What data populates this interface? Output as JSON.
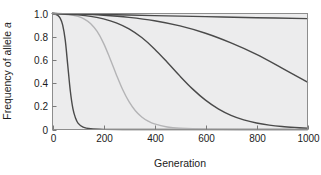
{
  "chart_data": {
    "type": "line",
    "title": "",
    "xlabel": "Generation",
    "ylabel": "Frequency of allele a",
    "ylabel_plain": "Frequency of allele ",
    "ylabel_italic": "a",
    "xlim": [
      0,
      1000
    ],
    "ylim": [
      0,
      1.0
    ],
    "xticks": [
      0,
      200,
      400,
      600,
      800,
      1000
    ],
    "xticklabels": [
      "0",
      "200",
      "400",
      "600",
      "800",
      "1000"
    ],
    "yticks": [
      0,
      0.2,
      0.4,
      0.6,
      0.8,
      1.0
    ],
    "yticklabels": [
      "0",
      "0.2",
      "0.4",
      "0.6",
      "0.8",
      "1.0"
    ],
    "grid": false,
    "legend": "none",
    "plot_background": "#ececed",
    "series": [
      {
        "name": "strong-selection",
        "color": "#4a4a4a",
        "width": 1.4,
        "x": [
          0,
          10,
          20,
          30,
          40,
          50,
          60,
          70,
          80,
          90,
          100,
          120,
          150,
          200,
          300,
          500,
          700,
          1000
        ],
        "y": [
          1.0,
          0.995,
          0.985,
          0.96,
          0.9,
          0.77,
          0.55,
          0.33,
          0.18,
          0.1,
          0.055,
          0.02,
          0.006,
          0.001,
          0.0,
          0.0,
          0.0,
          0.0
        ]
      },
      {
        "name": "moderate-selection-light",
        "color": "#b4b4b6",
        "width": 1.4,
        "x": [
          0,
          25,
          50,
          75,
          100,
          125,
          150,
          175,
          200,
          225,
          250,
          275,
          300,
          325,
          350,
          375,
          400,
          450,
          500,
          600,
          800,
          1000
        ],
        "y": [
          1.0,
          0.998,
          0.994,
          0.987,
          0.975,
          0.952,
          0.912,
          0.845,
          0.745,
          0.615,
          0.475,
          0.345,
          0.24,
          0.162,
          0.108,
          0.072,
          0.048,
          0.022,
          0.011,
          0.003,
          0.0,
          0.0
        ]
      },
      {
        "name": "weak-selection-dark",
        "color": "#4a4a4a",
        "width": 1.4,
        "x": [
          0,
          50,
          100,
          150,
          200,
          250,
          300,
          350,
          400,
          450,
          500,
          550,
          600,
          650,
          700,
          750,
          800,
          850,
          900,
          950,
          1000
        ],
        "y": [
          1.0,
          0.996,
          0.988,
          0.975,
          0.954,
          0.92,
          0.868,
          0.793,
          0.695,
          0.58,
          0.46,
          0.348,
          0.253,
          0.178,
          0.122,
          0.083,
          0.056,
          0.038,
          0.026,
          0.018,
          0.012
        ]
      },
      {
        "name": "very-weak-selection",
        "color": "#4a4a4a",
        "width": 1.4,
        "x": [
          0,
          100,
          200,
          300,
          400,
          500,
          600,
          700,
          800,
          900,
          1000
        ],
        "y": [
          1.0,
          0.995,
          0.985,
          0.967,
          0.938,
          0.893,
          0.83,
          0.747,
          0.648,
          0.53,
          0.408
        ]
      },
      {
        "name": "negligible-selection",
        "color": "#4a4a4a",
        "width": 1.4,
        "x": [
          0,
          200,
          400,
          600,
          800,
          1000
        ],
        "y": [
          1.0,
          0.991,
          0.982,
          0.973,
          0.964,
          0.956
        ]
      }
    ]
  }
}
